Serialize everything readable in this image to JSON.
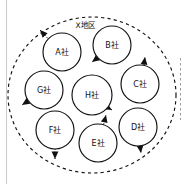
{
  "diagram": {
    "title": "X地区",
    "region": {
      "label": "X地区",
      "name": "region-boundary",
      "style": "dashed-ellipse",
      "center_x": 92,
      "center_y": 95,
      "radius_x": 84,
      "radius_y": 78,
      "stroke_color": "#111111"
    },
    "colors": {
      "stroke": "#111111",
      "background": "#ffffff",
      "frame_rule": "#c9c9c9",
      "faint_dash": "#9a9a9a"
    },
    "nodes": [
      {
        "id": "A",
        "label": "A社",
        "cx": 62,
        "cy": 52,
        "r": 19,
        "arrow": {
          "angle_deg": 225,
          "label": "arrow-out-upleft",
          "x1": 52,
          "y1": 43,
          "x2": 40,
          "y2": 30
        }
      },
      {
        "id": "B",
        "label": "B社",
        "cx": 112,
        "cy": 45,
        "r": 19,
        "arrow": {
          "angle_deg": 215,
          "label": "arrow-out-downleft",
          "x1": 104,
          "y1": 53,
          "x2": 92,
          "y2": 62
        }
      },
      {
        "id": "C",
        "label": "C社",
        "cx": 140,
        "cy": 84,
        "r": 19,
        "arrow": {
          "angle_deg": 270,
          "label": "arrow-out-up",
          "x1": 143,
          "y1": 72,
          "x2": 145,
          "y2": 57
        }
      },
      {
        "id": "D",
        "label": "D社",
        "cx": 138,
        "cy": 127,
        "r": 19,
        "arrow": {
          "angle_deg": 90,
          "label": "arrow-out-down",
          "x1": 139,
          "y1": 138,
          "x2": 141,
          "y2": 153
        }
      },
      {
        "id": "E",
        "label": "E社",
        "cx": 98,
        "cy": 143,
        "r": 19,
        "arrow": {
          "angle_deg": 270,
          "label": "arrow-out-up",
          "x1": 102,
          "y1": 131,
          "x2": 106,
          "y2": 115
        }
      },
      {
        "id": "F",
        "label": "F社",
        "cx": 55,
        "cy": 130,
        "r": 19,
        "arrow": {
          "angle_deg": 90,
          "label": "arrow-out-down",
          "x1": 55,
          "y1": 142,
          "x2": 55,
          "y2": 159
        }
      },
      {
        "id": "G",
        "label": "G社",
        "cx": 44,
        "cy": 90,
        "r": 19,
        "arrow": {
          "angle_deg": 205,
          "label": "arrow-out-downleft",
          "x1": 36,
          "y1": 96,
          "x2": 22,
          "y2": 105
        }
      },
      {
        "id": "H",
        "label": "H社",
        "cx": 92,
        "cy": 95,
        "r": 20,
        "arrow": {
          "angle_deg": 320,
          "label": "arrow-out-upright",
          "x1": 100,
          "y1": 103,
          "x2": 112,
          "y2": 110
        }
      }
    ],
    "extra_marks": [
      {
        "name": "left-frame-rule",
        "type": "vertical-rule",
        "x": 6
      },
      {
        "name": "right-faint-dashes",
        "type": "vertical-dashes",
        "x": 180
      }
    ]
  }
}
